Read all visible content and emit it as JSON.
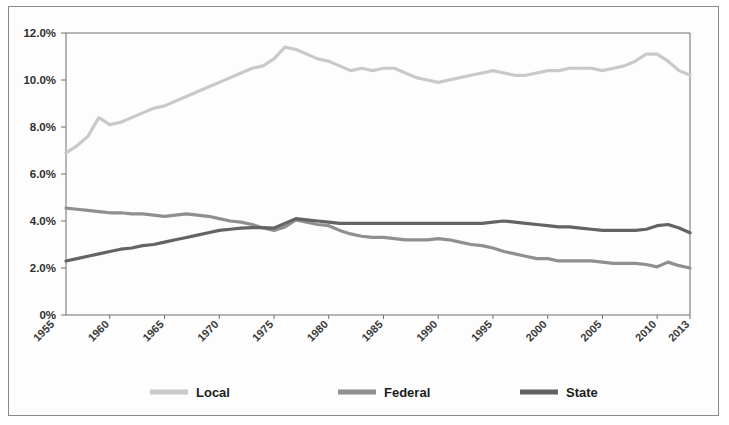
{
  "chart_data": {
    "type": "line",
    "title": "",
    "xlabel": "",
    "ylabel": "",
    "ylim": [
      0,
      12
    ],
    "xlim": [
      1956,
      2013
    ],
    "grid": false,
    "legend_position": "bottom",
    "y_ticks": [
      "0%",
      "2.0%",
      "4.0%",
      "6.0%",
      "8.0%",
      "10.0%",
      "12.0%"
    ],
    "y_tick_values": [
      0,
      2,
      4,
      6,
      8,
      10,
      12
    ],
    "x_ticks": [
      "1955",
      "1960",
      "1965",
      "1970",
      "1975",
      "1980",
      "1985",
      "1990",
      "1995",
      "2000",
      "2005",
      "2010",
      "2013"
    ],
    "x_tick_values": [
      1955,
      1960,
      1965,
      1970,
      1975,
      1980,
      1985,
      1990,
      1995,
      2000,
      2005,
      2010,
      2013
    ],
    "x": [
      1956,
      1957,
      1958,
      1959,
      1960,
      1961,
      1962,
      1963,
      1964,
      1965,
      1966,
      1967,
      1968,
      1969,
      1970,
      1971,
      1972,
      1973,
      1974,
      1975,
      1976,
      1977,
      1978,
      1979,
      1980,
      1981,
      1982,
      1983,
      1984,
      1985,
      1986,
      1987,
      1988,
      1989,
      1990,
      1991,
      1992,
      1993,
      1994,
      1995,
      1996,
      1997,
      1998,
      1999,
      2000,
      2001,
      2002,
      2003,
      2004,
      2005,
      2006,
      2007,
      2008,
      2009,
      2010,
      2011,
      2012,
      2013
    ],
    "series": [
      {
        "name": "Local",
        "color": "#c9c9c9",
        "values": [
          6.9,
          7.2,
          7.6,
          8.4,
          8.1,
          8.2,
          8.4,
          8.6,
          8.8,
          8.9,
          9.1,
          9.3,
          9.5,
          9.7,
          9.9,
          10.1,
          10.3,
          10.5,
          10.6,
          10.9,
          11.4,
          11.3,
          11.1,
          10.9,
          10.8,
          10.6,
          10.4,
          10.5,
          10.4,
          10.5,
          10.5,
          10.3,
          10.1,
          10.0,
          9.9,
          10.0,
          10.1,
          10.2,
          10.3,
          10.4,
          10.3,
          10.2,
          10.2,
          10.3,
          10.4,
          10.4,
          10.5,
          10.5,
          10.5,
          10.4,
          10.5,
          10.6,
          10.8,
          11.1,
          11.1,
          10.8,
          10.4,
          10.2
        ]
      },
      {
        "name": "Federal",
        "color": "#8f8f8f",
        "values": [
          4.55,
          4.5,
          4.45,
          4.4,
          4.35,
          4.35,
          4.3,
          4.3,
          4.25,
          4.2,
          4.25,
          4.3,
          4.25,
          4.2,
          4.1,
          4.0,
          3.95,
          3.85,
          3.7,
          3.6,
          3.75,
          4.05,
          3.95,
          3.85,
          3.8,
          3.6,
          3.45,
          3.35,
          3.3,
          3.3,
          3.25,
          3.2,
          3.2,
          3.2,
          3.25,
          3.2,
          3.1,
          3.0,
          2.95,
          2.85,
          2.7,
          2.6,
          2.5,
          2.4,
          2.4,
          2.3,
          2.3,
          2.3,
          2.3,
          2.25,
          2.2,
          2.2,
          2.2,
          2.15,
          2.05,
          2.25,
          2.1,
          2.0
        ]
      },
      {
        "name": "State",
        "color": "#636363",
        "values": [
          2.3,
          2.4,
          2.5,
          2.6,
          2.7,
          2.8,
          2.85,
          2.95,
          3.0,
          3.1,
          3.2,
          3.3,
          3.4,
          3.5,
          3.6,
          3.65,
          3.7,
          3.72,
          3.72,
          3.7,
          3.9,
          4.1,
          4.05,
          4.0,
          3.95,
          3.9,
          3.9,
          3.9,
          3.9,
          3.9,
          3.9,
          3.9,
          3.9,
          3.9,
          3.9,
          3.9,
          3.9,
          3.9,
          3.9,
          3.95,
          4.0,
          3.95,
          3.9,
          3.85,
          3.8,
          3.75,
          3.75,
          3.7,
          3.65,
          3.6,
          3.6,
          3.6,
          3.6,
          3.65,
          3.8,
          3.85,
          3.7,
          3.5
        ]
      }
    ],
    "legend": [
      {
        "label": "Local",
        "color": "#c9c9c9"
      },
      {
        "label": "Federal",
        "color": "#8f8f8f"
      },
      {
        "label": "State",
        "color": "#636363"
      }
    ]
  }
}
